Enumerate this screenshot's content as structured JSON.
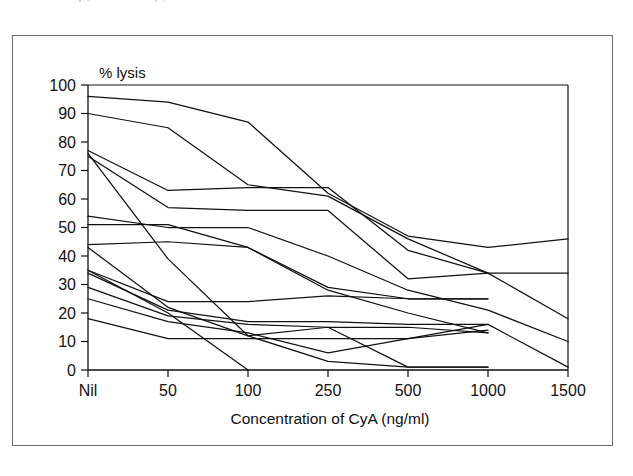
{
  "figure": {
    "y_axis_caption": "% lysis",
    "x_axis_title": "Concentration of CyA (ng/ml)"
  },
  "chart_data": {
    "type": "line",
    "title": "",
    "subtitle": "",
    "xlabel": "Concentration of CyA (ng/ml)",
    "ylabel": "% lysis",
    "y_caption_inside_plot": "% lysis",
    "categories": [
      "Nil",
      "50",
      "100",
      "250",
      "500",
      "1000",
      "1500"
    ],
    "x_tick_labels": [
      "Nil",
      "50",
      "100",
      "250",
      "500",
      "1000",
      "1500"
    ],
    "y_tick_labels": [
      "0",
      "10",
      "20",
      "30",
      "40",
      "50",
      "60",
      "70",
      "80",
      "90",
      "100"
    ],
    "y_ticks": [
      0,
      10,
      20,
      30,
      40,
      50,
      60,
      70,
      80,
      90,
      100
    ],
    "ylim": [
      0,
      100
    ],
    "x_scale": "categorical",
    "grid": false,
    "legend": false,
    "legend_position": "none",
    "line_color": "#111111",
    "background_color": "#ffffff",
    "series_count": 12,
    "annotations": [],
    "series": [
      {
        "name": "curve-1",
        "values": [
          96,
          94,
          87,
          62,
          47,
          43,
          46
        ]
      },
      {
        "name": "curve-2",
        "values": [
          90,
          85,
          65,
          61,
          46,
          34,
          34
        ]
      },
      {
        "name": "curve-3",
        "values": [
          77,
          63,
          64,
          64,
          42,
          34,
          18
        ]
      },
      {
        "name": "curve-4",
        "values": [
          75,
          57,
          56,
          56,
          32,
          34,
          null
        ]
      },
      {
        "name": "curve-5",
        "values": [
          54,
          50,
          50,
          40,
          28,
          21,
          10
        ]
      },
      {
        "name": "curve-6",
        "values": [
          51,
          51,
          43,
          29,
          25,
          25,
          null
        ]
      },
      {
        "name": "curve-7",
        "values": [
          44,
          45,
          43,
          28,
          20,
          13,
          null
        ]
      },
      {
        "name": "curve-8",
        "values": [
          35,
          24,
          24,
          26,
          25,
          25,
          null
        ]
      },
      {
        "name": "curve-9",
        "values": [
          34,
          21,
          17,
          17,
          16,
          16,
          1
        ]
      },
      {
        "name": "curve-10",
        "values": [
          29,
          19,
          16,
          15,
          15,
          13,
          null
        ]
      },
      {
        "name": "curve-11",
        "values": [
          25,
          17,
          13,
          6,
          11,
          16,
          null
        ]
      },
      {
        "name": "curve-12",
        "values": [
          18,
          11,
          11,
          11,
          11,
          14,
          null
        ]
      },
      {
        "name": "curve-13",
        "values": [
          76,
          39,
          12,
          3,
          1,
          1,
          null
        ]
      },
      {
        "name": "curve-14",
        "values": [
          43,
          22,
          12,
          15,
          1,
          1,
          null
        ]
      },
      {
        "name": "curve-15",
        "values": [
          35,
          20,
          0,
          null,
          null,
          null,
          null
        ]
      }
    ]
  }
}
